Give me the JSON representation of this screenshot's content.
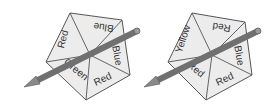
{
  "spinners": [
    {
      "name": "spinner-a",
      "sections": [
        "Blue",
        "Blue",
        "Red",
        "Green",
        "Red"
      ],
      "labels": {
        "top": "Blue",
        "right": "Blue",
        "bottom_right": "Red",
        "bottom_left": "Green",
        "left": "Red"
      }
    },
    {
      "name": "spinner-b",
      "sections": [
        "Red",
        "Blue",
        "Red",
        "Red",
        "Yellow"
      ],
      "labels": {
        "top": "Red",
        "right": "Blue",
        "bottom_right": "Red",
        "bottom_left": "Red",
        "left": "Yellow"
      }
    }
  ],
  "colors": {
    "face": "#ececec",
    "edge": "#555555",
    "pencil": "#7a7a7a"
  }
}
